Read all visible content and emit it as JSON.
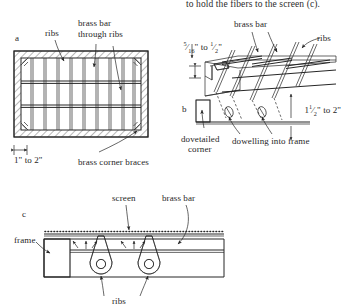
{
  "figure": {
    "caption_top": "to hold the fibers to the screen (c).",
    "panels": [
      {
        "key": "a",
        "label": "a"
      },
      {
        "key": "b",
        "label": "b"
      },
      {
        "key": "c",
        "label": "c"
      }
    ]
  },
  "panel_a": {
    "label": "a",
    "labels": {
      "ribs": "ribs",
      "brass_bar_l1": "brass bar",
      "brass_bar_l2": "through ribs",
      "corner_braces": "brass corner braces"
    },
    "dimension": {
      "whole_from": "1",
      "unit": "\"",
      "to": " to ",
      "whole_to": "2"
    },
    "dimension_text": "1\" to 2\""
  },
  "panel_b": {
    "label": "b",
    "labels": {
      "brass_bar": "brass bar",
      "ribs": "ribs",
      "dovetailed_l1": "dovetailed",
      "dovetailed_l2": "corner",
      "dowelling": "dowelling into frame"
    },
    "dim_thickness": {
      "num1": "5",
      "den1": "16",
      "unit": "\"",
      "to": " to ",
      "num2": "1",
      "den2": "2",
      "text": "5/16\" to 1/2\""
    },
    "dim_depth": {
      "whole": "1",
      "num": "1",
      "den": "2",
      "unit": "\"",
      "to": " to ",
      "end": "2",
      "text": "1 1/2\" to 2\""
    }
  },
  "panel_c": {
    "label": "c",
    "labels": {
      "screen": "screen",
      "brass_bar": "brass bar",
      "frame": "frame",
      "ribs": "ribs"
    }
  },
  "colors": {
    "ink": "#262626",
    "paper": "#ffffff",
    "hatch": "#4a4a4a",
    "rib_fill": "#8a8a8a"
  }
}
